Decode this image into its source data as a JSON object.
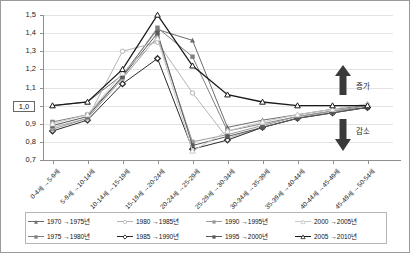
{
  "chart_data": {
    "type": "line",
    "title": "",
    "subtitle": "",
    "xlabel": "",
    "ylabel": "",
    "ylim": [
      0.7,
      1.5
    ],
    "ytick_values": [
      0.7,
      0.8,
      0.9,
      1.0,
      1.1,
      1.2,
      1.3,
      1.4,
      1.5
    ],
    "ytick_labels": [
      "0,7",
      "0,8",
      "0,9",
      "1,0",
      "1,1",
      "1,2",
      "1,3",
      "1,4",
      "1,5"
    ],
    "highlighted_ytick": "1,0",
    "grid": true,
    "legend_position": "bottom",
    "categories": [
      "0-4세 →5-9세",
      "5-9세 →10-14세",
      "10-14세 →15-19세",
      "15-19세 →20-24세",
      "20-24세 →25-29세",
      "25-29세 →30-34세",
      "30-34세 →35-39세",
      "35-39세 →40-44세",
      "40-44세 →45-49세",
      "45-49세 →50-54세"
    ],
    "series": [
      {
        "name": "1970 →1975년",
        "color": "#6d6d6d",
        "marker": "triangle",
        "values": [
          1.0,
          1.02,
          1.17,
          1.42,
          1.36,
          0.88,
          0.92,
          0.95,
          0.98,
          1.0
        ]
      },
      {
        "name": "1975 →1980년",
        "color": "#7f7f7f",
        "marker": "square",
        "values": [
          0.91,
          0.95,
          1.16,
          1.43,
          1.27,
          0.86,
          0.9,
          0.94,
          0.97,
          0.99
        ]
      },
      {
        "name": "1980 →1985년",
        "color": "#b4b4b4",
        "marker": "circle-open",
        "values": [
          0.88,
          0.93,
          1.3,
          1.35,
          1.07,
          0.82,
          0.88,
          0.93,
          0.97,
          1.0
        ]
      },
      {
        "name": "1985 →1990년",
        "color": "#2b2b2b",
        "marker": "diamond",
        "values": [
          0.86,
          0.92,
          1.12,
          1.26,
          0.76,
          0.81,
          0.88,
          0.93,
          0.96,
          0.99
        ]
      },
      {
        "name": "1990 →1995년",
        "color": "#9a9a9a",
        "marker": "square",
        "values": [
          0.87,
          0.93,
          1.15,
          1.38,
          0.8,
          0.84,
          0.89,
          0.94,
          0.97,
          1.0
        ]
      },
      {
        "name": "1995 →2000년",
        "color": "#5a5a5a",
        "marker": "square",
        "values": [
          0.89,
          0.94,
          1.16,
          1.4,
          0.78,
          0.83,
          0.88,
          0.93,
          0.96,
          0.99
        ]
      },
      {
        "name": "2000 →2005년",
        "color": "#c8c8c8",
        "marker": "triangle-open",
        "values": [
          0.9,
          0.95,
          1.18,
          1.37,
          0.75,
          0.86,
          0.91,
          0.95,
          0.98,
          1.01
        ]
      },
      {
        "name": "2005 →2010년",
        "color": "#1a1a1a",
        "marker": "triangle-open",
        "values": [
          1.0,
          1.02,
          1.2,
          1.5,
          1.22,
          1.06,
          1.02,
          1.0,
          1.0,
          1.0
        ]
      }
    ],
    "annotations": [
      {
        "text": "증가",
        "icon": "up-arrow"
      },
      {
        "text": "감소",
        "icon": "down-arrow"
      }
    ]
  }
}
